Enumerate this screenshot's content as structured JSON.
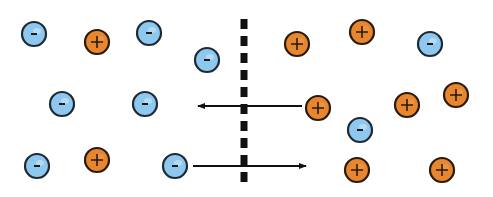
{
  "diagram": {
    "colors": {
      "negative_fill": "#8ec8ef",
      "negative_stroke": "#1d2a33",
      "positive_fill": "#e8862e",
      "positive_stroke": "#2a1a0e",
      "membrane": "#111111",
      "arrow": "#111111",
      "background": "#ffffff"
    },
    "membrane": {
      "x": 244,
      "y1": 19,
      "y2": 185,
      "dash": "10 7",
      "width": 7
    },
    "ion_radius": 12,
    "ions": [
      {
        "type": "negative",
        "symbol": "-",
        "x": 34,
        "y": 34
      },
      {
        "type": "positive",
        "symbol": "+",
        "x": 97,
        "y": 42
      },
      {
        "type": "negative",
        "symbol": "-",
        "x": 149,
        "y": 33
      },
      {
        "type": "negative",
        "symbol": "-",
        "x": 207,
        "y": 60
      },
      {
        "type": "negative",
        "symbol": "-",
        "x": 62,
        "y": 104
      },
      {
        "type": "negative",
        "symbol": "-",
        "x": 145,
        "y": 104
      },
      {
        "type": "negative",
        "symbol": "-",
        "x": 37,
        "y": 166
      },
      {
        "type": "positive",
        "symbol": "+",
        "x": 97,
        "y": 160
      },
      {
        "type": "negative",
        "symbol": "-",
        "x": 175,
        "y": 166
      },
      {
        "type": "positive",
        "symbol": "+",
        "x": 297,
        "y": 44
      },
      {
        "type": "positive",
        "symbol": "+",
        "x": 362,
        "y": 32
      },
      {
        "type": "negative",
        "symbol": "-",
        "x": 430,
        "y": 44
      },
      {
        "type": "positive",
        "symbol": "+",
        "x": 318,
        "y": 108
      },
      {
        "type": "positive",
        "symbol": "+",
        "x": 407,
        "y": 105
      },
      {
        "type": "positive",
        "symbol": "+",
        "x": 456,
        "y": 95
      },
      {
        "type": "negative",
        "symbol": "-",
        "x": 360,
        "y": 130
      },
      {
        "type": "positive",
        "symbol": "+",
        "x": 357,
        "y": 170
      },
      {
        "type": "positive",
        "symbol": "+",
        "x": 442,
        "y": 170
      }
    ],
    "arrows": [
      {
        "name": "positive-ion-flow-left",
        "x1": 302,
        "y1": 106,
        "x2": 198,
        "y2": 106
      },
      {
        "name": "negative-ion-flow-right",
        "x1": 193,
        "y1": 166,
        "x2": 306,
        "y2": 166
      }
    ]
  }
}
